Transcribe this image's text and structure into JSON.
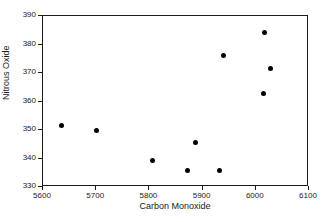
{
  "chart_data": {
    "type": "scatter",
    "title": "",
    "xlabel": "Carbon Monoxide",
    "ylabel": "Nitrous Oxide",
    "xlim": [
      5600,
      6100
    ],
    "ylim": [
      330,
      390
    ],
    "xticks": [
      5600,
      5700,
      5800,
      5900,
      6000,
      6100
    ],
    "yticks": [
      330,
      340,
      350,
      360,
      370,
      380,
      390
    ],
    "xtick_labels": [
      "5600",
      "5700",
      "5800",
      "5900",
      "6000",
      "6100"
    ],
    "ytick_labels": [
      "330",
      "340",
      "350",
      "360",
      "370",
      "380",
      "390"
    ],
    "grid": false,
    "legend": null,
    "marker": {
      "shape": "circle",
      "color": "#000000",
      "size": 5
    },
    "series": [
      {
        "name": "observations",
        "x": [
          5636,
          5703,
          5807,
          5874,
          5889,
          5933,
          5942,
          6017,
          6019,
          6030
        ],
        "y": [
          351.4,
          349.6,
          339.1,
          335.3,
          345.1,
          335.3,
          375.9,
          362.6,
          384.0,
          371.1
        ]
      }
    ]
  }
}
